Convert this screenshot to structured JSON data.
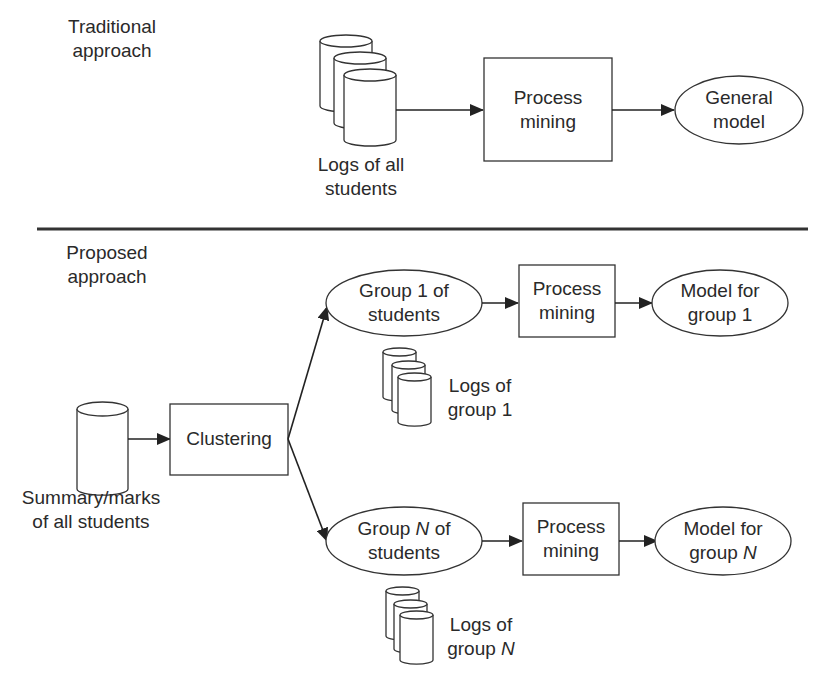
{
  "colors": {
    "stroke": "#333333",
    "text": "#2a2a2a",
    "background": "#ffffff"
  },
  "traditional": {
    "section_label": [
      "Traditional",
      "approach"
    ],
    "logs_label": [
      "Logs of all",
      "students"
    ],
    "logs_icon": "database-stack-icon",
    "process_box": [
      "Process",
      "mining"
    ],
    "output_node": [
      "General",
      "model"
    ]
  },
  "proposed": {
    "section_label": [
      "Proposed",
      "approach"
    ],
    "summary_label": [
      "Summary/marks",
      "of all students"
    ],
    "summary_icon": "database-icon",
    "clustering_box": "Clustering",
    "groups": [
      {
        "group_node": {
          "line1_pre": "Group ",
          "line1_var": "1",
          "line1_post": " of",
          "line2": "students"
        },
        "process_box": [
          "Process",
          "mining"
        ],
        "model_node": {
          "line1": "Model for",
          "line2_pre": "group ",
          "line2_var": "1"
        },
        "logs_label": {
          "line1": "Logs of",
          "line2_pre": "group ",
          "line2_var": "1"
        }
      },
      {
        "group_node": {
          "line1_pre": "Group ",
          "line1_var": "N",
          "line1_post": " of",
          "line2": "students"
        },
        "process_box": [
          "Process",
          "mining"
        ],
        "model_node": {
          "line1": "Model for",
          "line2_pre": "group ",
          "line2_var": "N"
        },
        "logs_label": {
          "line1": "Logs of",
          "line2_pre": "group ",
          "line2_var": "N"
        }
      }
    ]
  }
}
